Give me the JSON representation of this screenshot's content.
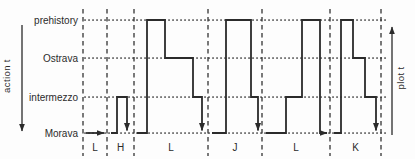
{
  "figure": {
    "colors": {
      "ink": "#2b2b2b",
      "background": "#fdfdfd"
    },
    "left_axis": {
      "label": "action t"
    },
    "right_axis": {
      "label": "plot t"
    },
    "levels": [
      {
        "name": "prehistory",
        "y": 20
      },
      {
        "name": "Ostrava",
        "y": 58
      },
      {
        "name": "intermezzo",
        "y": 97
      },
      {
        "name": "Morava",
        "y": 133
      }
    ],
    "level_label_x": 78,
    "level_line": {
      "x0": 85,
      "x1": 387
    },
    "dividers": [
      83,
      107,
      134,
      208,
      262,
      330,
      381
    ],
    "divider_top": 9,
    "divider_bottom": 156,
    "section_label_y": 151,
    "sections": [
      {
        "label": "L",
        "from": 83,
        "to": 107
      },
      {
        "label": "H",
        "from": 107,
        "to": 134
      },
      {
        "label": "L",
        "from": 134,
        "to": 208
      },
      {
        "label": "J",
        "from": 208,
        "to": 262
      },
      {
        "label": "L",
        "from": 262,
        "to": 330
      },
      {
        "label": "K",
        "from": 330,
        "to": 381
      }
    ],
    "action_arrow": {
      "x": 22,
      "y1": 25,
      "y2": 131
    },
    "plot_arrow": {
      "x": 392,
      "y1": 135,
      "y2": 27
    }
  },
  "chart_data": {
    "type": "line",
    "subtype": "step-timeline",
    "title": "",
    "xlabel": "plot t",
    "ylabel": "action t",
    "x_sections": [
      "L",
      "H",
      "L",
      "J",
      "L",
      "K"
    ],
    "y_categories": [
      "Morava",
      "intermezzo",
      "Ostrava",
      "prehistory"
    ],
    "grid": {
      "horizontal": "dotted level lines",
      "vertical": "dashed section dividers"
    },
    "legend": "none",
    "segments": [
      {
        "section_index": 0,
        "section": "L",
        "end_arrow": "right",
        "points": [
          [
            86,
            "Morava"
          ],
          [
            104,
            "Morava"
          ]
        ]
      },
      {
        "section_index": 1,
        "section": "H",
        "end_arrow": "down",
        "points": [
          [
            111,
            "Morava"
          ],
          [
            117,
            "Morava"
          ],
          [
            117,
            "intermezzo"
          ],
          [
            127,
            "intermezzo"
          ],
          [
            127,
            "Morava"
          ]
        ]
      },
      {
        "section_index": 2,
        "section": "L",
        "end_arrow": "down",
        "points": [
          [
            137,
            "Morava"
          ],
          [
            147,
            "Morava"
          ],
          [
            147,
            "prehistory"
          ],
          [
            165,
            "prehistory"
          ],
          [
            165,
            "Ostrava"
          ],
          [
            193,
            "Ostrava"
          ],
          [
            193,
            "intermezzo"
          ],
          [
            202,
            "intermezzo"
          ],
          [
            202,
            "Morava"
          ]
        ]
      },
      {
        "section_index": 3,
        "section": "J",
        "end_arrow": "down",
        "points": [
          [
            212,
            "Morava"
          ],
          [
            226,
            "Morava"
          ],
          [
            226,
            "prehistory"
          ],
          [
            251,
            "prehistory"
          ],
          [
            251,
            "intermezzo"
          ],
          [
            258,
            "intermezzo"
          ],
          [
            258,
            "Morava"
          ]
        ]
      },
      {
        "section_index": 4,
        "section": "L",
        "end_arrow": "right",
        "points": [
          [
            266,
            "Morava"
          ],
          [
            286,
            "Morava"
          ],
          [
            286,
            "intermezzo"
          ],
          [
            302,
            "intermezzo"
          ],
          [
            302,
            "prehistory"
          ],
          [
            320,
            "prehistory"
          ],
          [
            320,
            "Morava"
          ],
          [
            327,
            "Morava"
          ]
        ]
      },
      {
        "section_index": 5,
        "section": "K",
        "end_arrow": "down",
        "points": [
          [
            334,
            "Morava"
          ],
          [
            341,
            "Morava"
          ],
          [
            341,
            "prehistory"
          ],
          [
            353,
            "prehistory"
          ],
          [
            353,
            "Ostrava"
          ],
          [
            365,
            "Ostrava"
          ],
          [
            365,
            "intermezzo"
          ],
          [
            376,
            "intermezzo"
          ],
          [
            376,
            "Morava"
          ]
        ]
      }
    ]
  }
}
